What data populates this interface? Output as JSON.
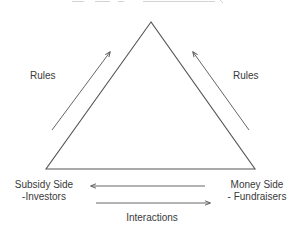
{
  "diagram": {
    "title_clipped": "",
    "triangle": {
      "apex": [
        151,
        22
      ],
      "base_left": [
        46,
        169
      ],
      "base_right": [
        255,
        169
      ],
      "stroke": "#555555"
    },
    "labels": {
      "rules_left": "Rules",
      "rules_right": "Rules",
      "subsidy_side_line1": "Subsidy Side",
      "subsidy_side_line2": "-Investors",
      "money_side_line1": "Money Side",
      "money_side_line2": "- Fundraisers",
      "interactions": "Interactions"
    },
    "arrows": [
      {
        "name": "rules-left-arrow",
        "from": [
          52,
          130
        ],
        "to": [
          110,
          52
        ],
        "direction": "up-right"
      },
      {
        "name": "rules-right-arrow",
        "from": [
          249,
          130
        ],
        "to": [
          193,
          52
        ],
        "direction": "up-left"
      },
      {
        "name": "interaction-arrow-to-subsidy",
        "from": [
          205,
          186
        ],
        "to": [
          91,
          186
        ],
        "direction": "left"
      },
      {
        "name": "interaction-arrow-to-money",
        "from": [
          96,
          203
        ],
        "to": [
          210,
          203
        ],
        "direction": "right"
      }
    ],
    "colors": {
      "line": "#555555",
      "text": "#3a3a3a",
      "background": "#ffffff"
    }
  }
}
